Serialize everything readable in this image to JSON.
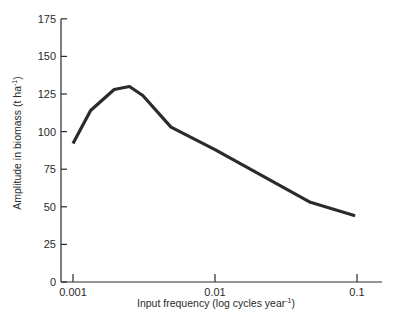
{
  "chart_data": {
    "type": "line",
    "title": "",
    "xlabel": "Input frequency (log cycles year⁻¹)",
    "xlabel_main": "Input frequency (log cycles year",
    "xlabel_sup": "-1",
    "xlabel_close": ")",
    "ylabel": "Amplitude in biomass (t ha⁻¹)",
    "ylabel_main": "Amplitude in biomass (t ha",
    "ylabel_sup": "-1",
    "ylabel_close": ")",
    "xscale": "log",
    "xlim": [
      0.001,
      0.15
    ],
    "ylim": [
      0,
      175
    ],
    "xticks": [
      0.001,
      0.01,
      0.1
    ],
    "xtick_labels": [
      "0.001",
      "0.01",
      "0.1"
    ],
    "yticks": [
      0,
      25,
      50,
      75,
      100,
      125,
      150,
      175
    ],
    "ytick_labels": [
      "0",
      "25",
      "50",
      "75",
      "100",
      "125",
      "150",
      "175"
    ],
    "grid": false,
    "legend": null,
    "series": [
      {
        "name": "Amplitude",
        "color": "#2b2b2b",
        "x": [
          0.001,
          0.00133,
          0.00195,
          0.0025,
          0.0031,
          0.0049,
          0.01,
          0.047,
          0.097
        ],
        "y": [
          92,
          114,
          128,
          130,
          124,
          103,
          88,
          53,
          44
        ]
      }
    ]
  }
}
